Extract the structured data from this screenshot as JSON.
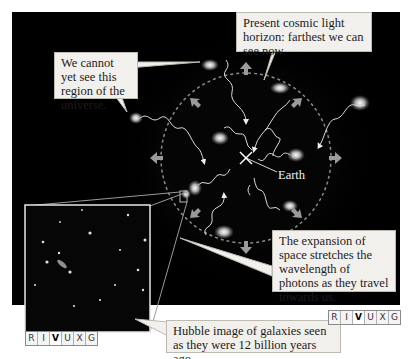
{
  "callouts": {
    "horizon": "Present cosmic light horizon: farthest we can see now.",
    "unseen": "We cannot yet see this region of the universe.",
    "expansion": "The expansion of space stretches the wavelength of photons as they travel towards us.",
    "hubble": "Hubble image of galaxies seen as they were 12 billion years ago."
  },
  "labels": {
    "earth": "Earth"
  },
  "rivuxg_left": {
    "letters": [
      "R",
      "I",
      "V",
      "U",
      "X",
      "G"
    ],
    "active": "V"
  },
  "rivuxg_right": {
    "letters": [
      "R",
      "I",
      "V",
      "U",
      "X",
      "G"
    ],
    "active": "V"
  },
  "colors": {
    "background": "#000000",
    "callout_fill": "#f2f0ec",
    "horizon_dash": "#8a8a8a",
    "arrow": "#9a9a9a"
  }
}
